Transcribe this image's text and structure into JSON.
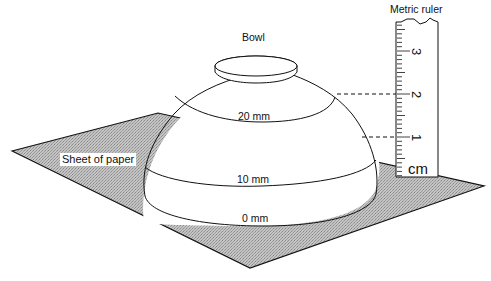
{
  "diagram": {
    "labels": {
      "bowl": "Bowl",
      "ruler": "Metric ruler",
      "paper": "Sheet of paper"
    },
    "contours": [
      {
        "label": "0 mm"
      },
      {
        "label": "10 mm"
      },
      {
        "label": "20 mm"
      }
    ],
    "ruler": {
      "unit": "cm",
      "ticks": [
        "1",
        "2",
        "3"
      ]
    },
    "colors": {
      "paper_fill": "#b8b8b8",
      "outline": "#111111",
      "background": "#ffffff"
    }
  }
}
